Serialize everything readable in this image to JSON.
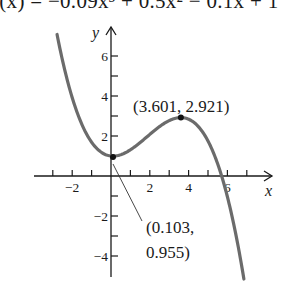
{
  "title": "f(x) = −0.09x³ + 0.5x² − 0.1x + 1",
  "chart_data": {
    "type": "line",
    "title": "f(x) = −0.09x³ + 0.5x² − 0.1x + 1",
    "function": "-0.09*x^3 + 0.5*x^2 - 0.1*x + 1",
    "xlabel": "x",
    "ylabel": "y",
    "xlim": [
      -2.8,
      7.5
    ],
    "ylim": [
      -5.1,
      7.3
    ],
    "x_ticks": [
      -3,
      -2,
      -1,
      1,
      2,
      3,
      4,
      5,
      6,
      7
    ],
    "x_tick_labels": [
      {
        "value": -2,
        "label": "−2"
      },
      {
        "value": 2,
        "label": "2"
      },
      {
        "value": 4,
        "label": "4"
      },
      {
        "value": 6,
        "label": "6"
      }
    ],
    "y_ticks": [
      -4,
      -3,
      -2,
      -1,
      1,
      2,
      3,
      4,
      5,
      6
    ],
    "y_tick_labels": [
      {
        "value": 6,
        "label": "6"
      },
      {
        "value": 4,
        "label": "4"
      },
      {
        "value": 2,
        "label": "2"
      },
      {
        "value": -2,
        "label": "−2"
      },
      {
        "value": -4,
        "label": "−4"
      }
    ],
    "series": [
      {
        "name": "f(x)",
        "x_range": [
          -2.78,
          6.85
        ],
        "color": "#6b6b6b"
      }
    ],
    "points": [
      {
        "name": "relative-minimum",
        "x": 0.103,
        "y": 0.955,
        "label_line1": "(0.103,",
        "label_line2": "0.955)"
      },
      {
        "name": "relative-maximum",
        "x": 3.601,
        "y": 2.921,
        "label": "(3.601, 2.921)"
      }
    ],
    "grid": false,
    "legend": "none"
  },
  "colors": {
    "curve": "#6b6b6b",
    "axis": "#1a1a1a",
    "point": "#111111"
  }
}
